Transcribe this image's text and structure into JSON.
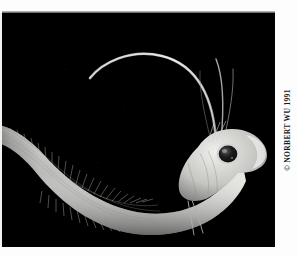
{
  "page": {
    "type": "photograph",
    "orientation": "landscape",
    "background_color": "#ffffff",
    "plate_color": "#000000"
  },
  "photo": {
    "subject": "deep-sea elongate fish (grenadier / rattail) with long trailing head filaments",
    "medium": "black-and-white underwater photograph",
    "background": "black water column",
    "tones": {
      "background": "#000000",
      "body_light": "#e2e2e0",
      "body_mid": "#9a9a98",
      "body_shadow": "#4a4a49",
      "eye_dark": "#141414",
      "eye_ring": "#cccccc",
      "filament": "#d8d8d6"
    },
    "features": [
      "long tapering eel-like body curving from lower-left to right",
      "blunt rounded snout at right",
      "single large dark eye behind the snout",
      "two long whip-like filaments arcing up and over to the upper left",
      "dense fin rays along dorsal and ventral margins of the tail",
      "two thin pelvic filaments hanging below the mid-body"
    ]
  },
  "credit": {
    "text": "© NORBERT WU 1991",
    "symbol": "©",
    "photographer": "NORBERT WU",
    "year": "1991",
    "position": "right margin, rotated 90° counter-clockwise",
    "color": "#1b1b1b"
  }
}
